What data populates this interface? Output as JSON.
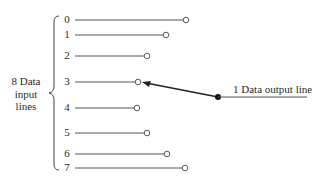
{
  "diagram": {
    "input_group_label": [
      "8 Data",
      "input",
      "lines"
    ],
    "output_label": "1 Data output line",
    "inputs": [
      {
        "label": "0",
        "y": 20,
        "end_x": 186
      },
      {
        "label": "1",
        "y": 35,
        "end_x": 166
      },
      {
        "label": "2",
        "y": 56,
        "end_x": 147
      },
      {
        "label": "3",
        "y": 82,
        "end_x": 138
      },
      {
        "label": "4",
        "y": 108,
        "end_x": 137
      },
      {
        "label": "5",
        "y": 133,
        "end_x": 147
      },
      {
        "label": "6",
        "y": 154,
        "end_x": 167
      },
      {
        "label": "7",
        "y": 168,
        "end_x": 185
      }
    ],
    "selected_input": "3",
    "colors": {
      "line": "#555555",
      "arrow": "#222222"
    }
  }
}
